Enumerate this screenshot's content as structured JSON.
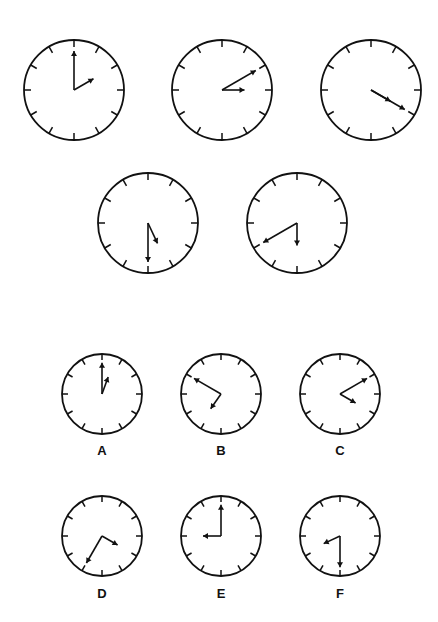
{
  "colors": {
    "stroke": "#111111",
    "background": "#ffffff"
  },
  "clocks": [
    {
      "id": "top-1",
      "cx": 74,
      "cy": 90,
      "r": 50,
      "minute_angle": 0,
      "hour_angle": 60,
      "label": ""
    },
    {
      "id": "top-2",
      "cx": 222,
      "cy": 90,
      "r": 50,
      "minute_angle": 60,
      "hour_angle": 90,
      "label": ""
    },
    {
      "id": "top-3",
      "cx": 371,
      "cy": 90,
      "r": 50,
      "minute_angle": 120,
      "hour_angle": 120,
      "label": ""
    },
    {
      "id": "mid-1",
      "cx": 148,
      "cy": 223,
      "r": 50,
      "minute_angle": 180,
      "hour_angle": 155,
      "label": ""
    },
    {
      "id": "mid-2",
      "cx": 297,
      "cy": 223,
      "r": 50,
      "minute_angle": 240,
      "hour_angle": 180,
      "label": ""
    },
    {
      "id": "A",
      "cx": 102,
      "cy": 394,
      "r": 40,
      "minute_angle": 0,
      "hour_angle": 20,
      "label": "A"
    },
    {
      "id": "B",
      "cx": 221,
      "cy": 394,
      "r": 40,
      "minute_angle": 300,
      "hour_angle": 215,
      "label": "B"
    },
    {
      "id": "C",
      "cx": 340,
      "cy": 394,
      "r": 40,
      "minute_angle": 60,
      "hour_angle": 120,
      "label": "C"
    },
    {
      "id": "D",
      "cx": 102,
      "cy": 536,
      "r": 40,
      "minute_angle": 210,
      "hour_angle": 120,
      "label": "D"
    },
    {
      "id": "E",
      "cx": 221,
      "cy": 536,
      "r": 40,
      "minute_angle": 0,
      "hour_angle": 270,
      "label": "E"
    },
    {
      "id": "F",
      "cx": 340,
      "cy": 536,
      "r": 40,
      "minute_angle": 180,
      "hour_angle": 245,
      "label": "F"
    }
  ],
  "labels": {
    "A": "A",
    "B": "B",
    "C": "C",
    "D": "D",
    "E": "E",
    "F": "F"
  }
}
